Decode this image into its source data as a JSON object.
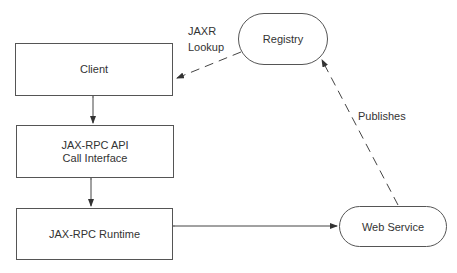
{
  "nodes": {
    "client": {
      "label": "Client"
    },
    "api": {
      "line1": "JAX-RPC API",
      "line2": "Call Interface"
    },
    "runtime": {
      "label": "JAX-RPC Runtime"
    },
    "registry": {
      "label": "Registry"
    },
    "web_service": {
      "label": "Web Service"
    }
  },
  "edges": {
    "lookup": {
      "line1": "JAXR",
      "line2": "Lookup"
    },
    "publishes": {
      "label": "Publishes"
    }
  },
  "colors": {
    "stroke": "#555555",
    "text": "#333333",
    "background": "#ffffff"
  }
}
